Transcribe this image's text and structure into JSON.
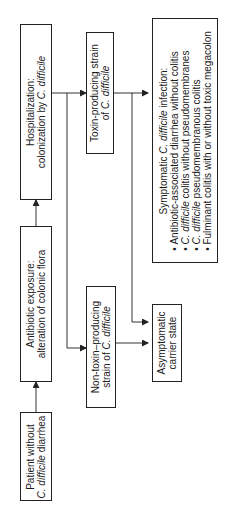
{
  "diagram": {
    "orientation": "rotated -90deg (reads bottom-to-top)",
    "nodes": {
      "patient": {
        "line1": "Patient without",
        "line2_italic": "C. difficile",
        "line2_rest": " diarrhea"
      },
      "antibiotic": {
        "line1": "Antibiotic exposure:",
        "line2": "alteration of colonic flora"
      },
      "hospitalization": {
        "line1": "Hospitalization:",
        "line2_pre": "colonization by ",
        "line2_italic": "C. difficile"
      },
      "non_toxin": {
        "line1": "Non-toxin–producing",
        "line2_pre": "strain of ",
        "line2_italic": "C. difficile"
      },
      "toxin": {
        "line1": "Toxin-producing strain",
        "line2_pre": "of ",
        "line2_italic": "C. difficile"
      },
      "asymptomatic": {
        "line1": "Asymptomatic",
        "line2": "carrier state"
      },
      "symptomatic": {
        "title_pre": "Symptomatic ",
        "title_italic": "C. difficile",
        "title_post": " infection:",
        "bullets": [
          {
            "pre": "Antibiotic-associated diarrhea without colitis",
            "italic": "",
            "post": ""
          },
          {
            "pre": "",
            "italic": "C. difficile",
            "post": " colitis without pseudomembranes"
          },
          {
            "pre": "",
            "italic": "C. difficile",
            "post": " pseudomembranous colitis"
          },
          {
            "pre": "Fulminant colitis with or without toxic megacolon",
            "italic": "",
            "post": ""
          }
        ],
        "bullet_char": "•"
      }
    },
    "edges": [
      {
        "from": "patient",
        "to": "antibiotic"
      },
      {
        "from": "antibiotic",
        "to": "hospitalization"
      },
      {
        "from": "hospitalization",
        "to": "toxin"
      },
      {
        "from": "hospitalization",
        "to": "non_toxin"
      },
      {
        "from": "toxin",
        "to": "symptomatic"
      },
      {
        "from": "toxin",
        "to": "asymptomatic"
      },
      {
        "from": "non_toxin",
        "to": "asymptomatic"
      }
    ]
  }
}
